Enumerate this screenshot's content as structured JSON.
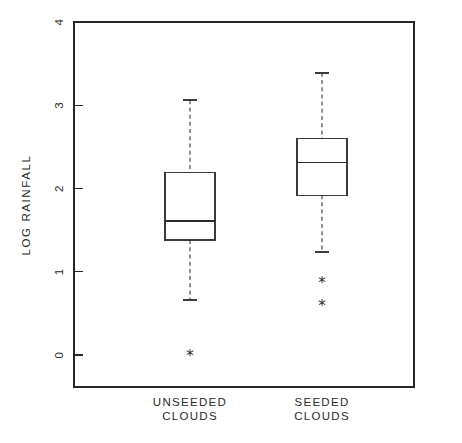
{
  "chart_data": {
    "type": "box",
    "title": "",
    "xlabel": "",
    "ylabel": "LOG RAINFALL",
    "ylim": [
      0,
      4
    ],
    "yticks": [
      0,
      1,
      2,
      3,
      4
    ],
    "ytick_labels": [
      "0",
      "1",
      "2",
      "3",
      "4"
    ],
    "grid": false,
    "legend": false,
    "categories": [
      "UNSEEDED CLOUDS",
      "SEEDED CLOUDS"
    ],
    "boxes": [
      {
        "label_line1": "UNSEEDED",
        "label_line2": "CLOUDS",
        "whisker_low": 0.66,
        "q1": 1.38,
        "median": 1.61,
        "q3": 2.19,
        "whisker_high": 3.06,
        "outliers": [
          0.0
        ]
      },
      {
        "label_line1": "SEEDED",
        "label_line2": "CLOUDS",
        "whisker_low": 1.24,
        "q1": 1.92,
        "median": 2.31,
        "q3": 2.6,
        "whisker_high": 3.39,
        "outliers": [
          0.87,
          0.59
        ]
      }
    ],
    "outlier_glyph": "*",
    "colors": {
      "axis": "#262626",
      "box_stroke": "#3a3a3a",
      "median": "#2b2b2b",
      "whisker": "#555555",
      "outlier": "#2b2b2b",
      "background": "#ffffff"
    }
  }
}
